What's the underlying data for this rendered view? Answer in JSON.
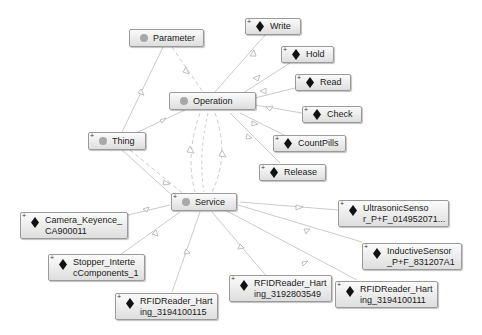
{
  "diagram": {
    "colors": {
      "background": "#ffffff",
      "edge": "#bdbdbd",
      "node_border": "#9a9a9a",
      "class_dot": "#a8a8a8",
      "individual_diamond": "#111111"
    },
    "classes": [
      {
        "id": "parameter",
        "label": "Parameter",
        "expandable": false
      },
      {
        "id": "operation",
        "label": "Operation",
        "expandable": false
      },
      {
        "id": "thing",
        "label": "Thing",
        "expandable": true
      },
      {
        "id": "service",
        "label": "Service",
        "expandable": true
      }
    ],
    "individuals": [
      {
        "id": "write",
        "label": "Write"
      },
      {
        "id": "hold",
        "label": "Hold"
      },
      {
        "id": "read",
        "label": "Read"
      },
      {
        "id": "check",
        "label": "Check"
      },
      {
        "id": "countpills",
        "label": "CountPills"
      },
      {
        "id": "release",
        "label": "Release"
      },
      {
        "id": "ultrasonic",
        "label": "UltrasonicSenso\nr_P+F_014952071..."
      },
      {
        "id": "inductive",
        "label": "InductiveSensor\n_P+F_831207A1"
      },
      {
        "id": "rfid111",
        "label": "RFIDReader_Hart\ning_3194100111"
      },
      {
        "id": "rfid549",
        "label": "RFIDReader_Hart\ning_3192803549"
      },
      {
        "id": "rfid115",
        "label": "RFIDReader_Hart\ning_3194100115"
      },
      {
        "id": "stopper",
        "label": "Stopper_Interte\ncComponents_1"
      },
      {
        "id": "camera",
        "label": "Camera_Keyence_\nCA900011"
      }
    ],
    "edges": [
      {
        "from": "parameter",
        "to": "operation",
        "style": "dashed"
      },
      {
        "from": "parameter",
        "to": "thing",
        "style": "solid"
      },
      {
        "from": "operation",
        "to": "thing",
        "style": "solid"
      },
      {
        "from": "operation",
        "to": "write",
        "style": "solid"
      },
      {
        "from": "operation",
        "to": "hold",
        "style": "solid"
      },
      {
        "from": "operation",
        "to": "read",
        "style": "solid"
      },
      {
        "from": "operation",
        "to": "check",
        "style": "solid"
      },
      {
        "from": "operation",
        "to": "countpills",
        "style": "solid"
      },
      {
        "from": "operation",
        "to": "release",
        "style": "solid"
      },
      {
        "from": "operation",
        "to": "service",
        "style": "dashed"
      },
      {
        "from": "service",
        "to": "operation",
        "style": "dashed"
      },
      {
        "from": "thing",
        "to": "service",
        "style": "dashed"
      },
      {
        "from": "service",
        "to": "camera",
        "style": "solid"
      },
      {
        "from": "service",
        "to": "stopper",
        "style": "solid"
      },
      {
        "from": "service",
        "to": "rfid115",
        "style": "solid"
      },
      {
        "from": "service",
        "to": "rfid549",
        "style": "solid"
      },
      {
        "from": "service",
        "to": "rfid111",
        "style": "solid"
      },
      {
        "from": "service",
        "to": "inductive",
        "style": "solid"
      },
      {
        "from": "service",
        "to": "ultrasonic",
        "style": "solid"
      }
    ]
  }
}
